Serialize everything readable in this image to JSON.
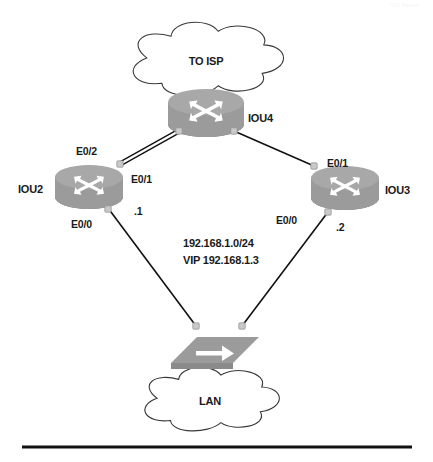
{
  "page": {
    "watermark": "IOS Basics"
  },
  "diagram": {
    "type": "network-topology",
    "clouds": [
      {
        "id": "isp",
        "label": "TO ISP",
        "cx": 206,
        "cy": 61,
        "rx": 76,
        "ry": 31
      },
      {
        "id": "lan",
        "label": "LAN",
        "cx": 210,
        "cy": 401,
        "rx": 68,
        "ry": 27
      }
    ],
    "routers": [
      {
        "id": "iou4",
        "label": "IOU4",
        "cx": 206,
        "cy": 113,
        "rx": 38,
        "ry": 13,
        "body": 22,
        "label_x": 248,
        "label_y": 112,
        "align": "left"
      },
      {
        "id": "iou2",
        "label": "IOU2",
        "cx": 89,
        "cy": 187,
        "rx": 34,
        "ry": 12,
        "body": 20,
        "label_x": 18,
        "label_y": 183,
        "align": "left"
      },
      {
        "id": "iou3",
        "label": "IOU3",
        "cx": 345,
        "cy": 188,
        "rx": 34,
        "ry": 12,
        "body": 20,
        "label_x": 385,
        "label_y": 184,
        "align": "left"
      }
    ],
    "switches": [
      {
        "id": "sw1",
        "cx": 215,
        "cy": 350,
        "w": 62,
        "h": 26
      }
    ],
    "links": [
      {
        "id": "iou2-iou4",
        "from": "iou2",
        "to": "iou4",
        "style": "double",
        "x1": 120,
        "y1": 164,
        "x2": 179,
        "y2": 131
      },
      {
        "id": "iou4-iou3",
        "from": "iou4",
        "to": "iou3",
        "style": "single",
        "x1": 234,
        "y1": 131,
        "x2": 314,
        "y2": 166
      },
      {
        "id": "iou2-sw1",
        "from": "iou2",
        "to": "sw1",
        "style": "single",
        "x1": 108,
        "y1": 208,
        "x2": 196,
        "y2": 326
      },
      {
        "id": "iou3-sw1",
        "from": "iou3",
        "to": "sw1",
        "style": "single",
        "x1": 328,
        "y1": 212,
        "x2": 242,
        "y2": 326
      }
    ],
    "connector_dots": [
      {
        "id": "dot-iou4-left",
        "x": 179,
        "y": 131
      },
      {
        "id": "dot-iou4-right",
        "x": 234,
        "y": 131
      },
      {
        "id": "dot-iou2-e01",
        "x": 120,
        "y": 164
      },
      {
        "id": "dot-iou3-e01",
        "x": 314,
        "y": 166
      },
      {
        "id": "dot-iou2-e00",
        "x": 108,
        "y": 209
      },
      {
        "id": "dot-iou3-e00",
        "x": 328,
        "y": 212
      },
      {
        "id": "dot-sw-left",
        "x": 196,
        "y": 326
      },
      {
        "id": "dot-sw-right",
        "x": 242,
        "y": 326
      }
    ],
    "interface_labels": [
      {
        "id": "iou2-e0-2",
        "text": "E0/2",
        "x": 76,
        "y": 145
      },
      {
        "id": "iou2-e0-1",
        "text": "E0/1",
        "x": 131,
        "y": 173
      },
      {
        "id": "iou2-e0-0",
        "text": "E0/0",
        "x": 71,
        "y": 218
      },
      {
        "id": "iou2-ip",
        "text": ".1",
        "x": 134,
        "y": 205
      },
      {
        "id": "iou3-e0-1",
        "text": "E0/1",
        "x": 327,
        "y": 157
      },
      {
        "id": "iou3-e0-0",
        "text": "E0/0",
        "x": 276,
        "y": 214
      },
      {
        "id": "iou3-ip",
        "text": ".2",
        "x": 336,
        "y": 221
      }
    ],
    "network_labels": [
      {
        "id": "subnet",
        "text": "192.168.1.0/24",
        "x": 183,
        "y": 237
      },
      {
        "id": "vip",
        "text": "VIP 192.168.1.3",
        "x": 183,
        "y": 254
      }
    ],
    "colors": {
      "device_fill": "#9b9b9b",
      "device_top": "#a8a8a8",
      "device_shade": "#8a8a8a",
      "arrow": "#ffffff",
      "outline": "#3a3a3a",
      "link": "#111111",
      "dot": "#c9c9c9",
      "dot_stroke": "#8e8e8e",
      "text": "#1a1a1a",
      "rule": "#111111"
    },
    "footer_rule": {
      "x1": 22,
      "x2": 412,
      "y": 447,
      "thickness": 3
    }
  }
}
